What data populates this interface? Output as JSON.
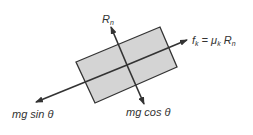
{
  "diagram": {
    "block": {
      "fill": "#d4d4d4",
      "stroke": "#333333"
    },
    "arrow_color": "#333333",
    "labels": {
      "normal_force": {
        "main": "R",
        "sub": "n"
      },
      "friction": {
        "f": "f",
        "f_sub": "k",
        "eq": " = ",
        "mu": "μ",
        "mu_sub": "k",
        "R": " R",
        "R_sub": "n"
      },
      "parallel_weight": "mg sin θ",
      "perpendicular_weight": "mg cos θ"
    }
  }
}
